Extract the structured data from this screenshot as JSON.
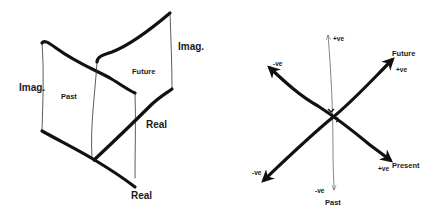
{
  "left_diagram": {
    "title": "Complex time planes",
    "labels": {
      "imag_left": "Imag.",
      "past": "Past",
      "future": "Future",
      "imag_right": "Imag.",
      "real_upper": "Real",
      "real_lower": "Real"
    }
  },
  "right_diagram": {
    "title": "Time axes",
    "labels": {
      "top_pos": "+ve",
      "future": "Future",
      "future_pos": "+ve",
      "upper_left_neg": "-ve",
      "lower_left_neg": "-ve",
      "present_pos": "+ve",
      "present": "Present",
      "bottom_neg": "-ve",
      "past": "Past"
    }
  },
  "colors": {
    "line": "#111111",
    "background": "#ffffff"
  }
}
